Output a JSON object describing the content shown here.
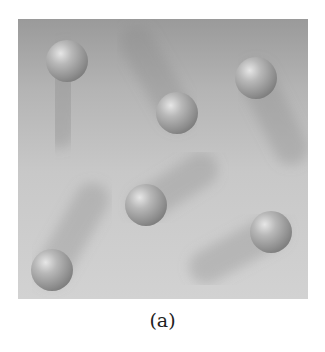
{
  "figure": {
    "caption": "(a)",
    "panel": {
      "background_top": "#9a9a9a",
      "background_bottom": "#d2d2d2"
    },
    "spheres": [
      {
        "id": "sphere-1",
        "cx": 49,
        "cy": 42,
        "r": 21,
        "trail": {
          "dx": -8,
          "dy": 70
        }
      },
      {
        "id": "sphere-2",
        "cx": 159,
        "cy": 94,
        "r": 21,
        "trail": {
          "dx": -40,
          "dy": -70
        }
      },
      {
        "id": "sphere-3",
        "cx": 238,
        "cy": 59,
        "r": 21,
        "trail": {
          "dx": 35,
          "dy": 70
        }
      },
      {
        "id": "sphere-4",
        "cx": 128,
        "cy": 186,
        "r": 21,
        "trail": {
          "dx": 55,
          "dy": -35
        }
      },
      {
        "id": "sphere-5",
        "cx": 34,
        "cy": 251,
        "r": 21,
        "trail": {
          "dx": 40,
          "dy": -70
        }
      },
      {
        "id": "sphere-6",
        "cx": 253,
        "cy": 213,
        "r": 21,
        "trail": {
          "dx": -65,
          "dy": 35
        }
      }
    ]
  }
}
